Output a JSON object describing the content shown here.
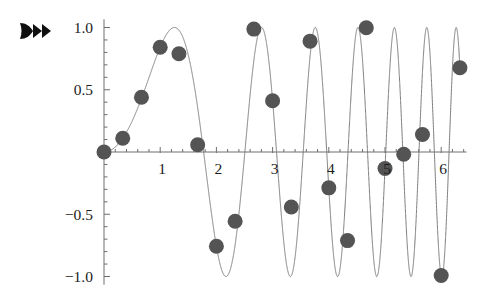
{
  "figure": {
    "background_color": "#ffffff",
    "marker_icon": "fast-forward-icon"
  },
  "chart_data": {
    "type": "line",
    "title": "",
    "subtitle": "",
    "xlabel": "",
    "ylabel": "",
    "grid": false,
    "legend": null,
    "xlim": [
      0,
      6.45
    ],
    "ylim": [
      -1.05,
      1.05
    ],
    "x_ticks_major": [
      1,
      2,
      3,
      4,
      5,
      6
    ],
    "x_tick_labels": [
      "1",
      "2",
      "3",
      "4",
      "5",
      "6"
    ],
    "x_minor_tick_step": 0.2,
    "y_ticks_major": [
      -1.0,
      -0.5,
      0.5,
      1.0
    ],
    "y_tick_labels": [
      "-1.0",
      "-0.5",
      "0.5",
      "1.0"
    ],
    "y_minor_tick_step": 0.1,
    "axis_color": "#6e6e6e",
    "curve": {
      "name": "sin(x^2)",
      "color": "#7a7a7a",
      "width": 1,
      "x_start": 0,
      "x_end": 6.33
    },
    "markers": {
      "name": "samples of sin(x^2)",
      "color": "#545454",
      "shape": "circle",
      "radius_px": 7.5,
      "sample_step": 0.3333333333,
      "x": [
        0,
        0.3333,
        0.6667,
        1.0,
        1.3333,
        1.6667,
        2.0,
        2.3333,
        2.6667,
        3.0,
        3.3333,
        3.6667,
        4.0,
        4.3333,
        4.6667,
        5.0,
        5.3333,
        5.6667,
        6.0,
        6.3333
      ],
      "values": [
        0,
        0.1109,
        0.4399,
        0.8415,
        0.7895,
        0.0581,
        -0.7568,
        -0.5557,
        0.987,
        0.4121,
        -0.4414,
        0.8905,
        -0.2879,
        -0.7118,
        0.9975,
        -0.1324,
        -0.0185,
        0.1406,
        -0.9918,
        0.6765
      ]
    },
    "annotations": []
  }
}
